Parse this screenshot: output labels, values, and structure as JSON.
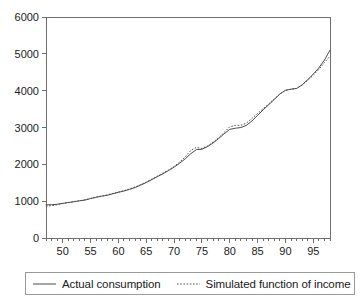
{
  "chart_data": {
    "type": "line",
    "title": "",
    "subtitle": "",
    "xlabel": "",
    "ylabel": "",
    "xlim": [
      47,
      98
    ],
    "ylim": [
      0,
      6000
    ],
    "grid": false,
    "legend_position": "bottom",
    "y_ticks": [
      0,
      1000,
      2000,
      3000,
      4000,
      5000,
      6000
    ],
    "y_tick_labels": [
      "0",
      "1000",
      "2000",
      "3000",
      "4000",
      "5000",
      "6000"
    ],
    "x_ticks": [
      50,
      55,
      60,
      65,
      70,
      75,
      80,
      85,
      90,
      95
    ],
    "x_tick_labels": [
      "50",
      "55",
      "60",
      "65",
      "70",
      "75",
      "80",
      "85",
      "90",
      "95"
    ],
    "x_minor_tick_step": 1,
    "x": [
      47,
      48,
      49,
      50,
      51,
      52,
      53,
      54,
      55,
      56,
      57,
      58,
      59,
      60,
      61,
      62,
      63,
      64,
      65,
      66,
      67,
      68,
      69,
      70,
      71,
      72,
      73,
      74,
      75,
      76,
      77,
      78,
      79,
      80,
      81,
      82,
      83,
      84,
      85,
      86,
      87,
      88,
      89,
      90,
      91,
      92,
      93,
      94,
      95,
      96,
      97,
      98
    ],
    "series": [
      {
        "name": "Actual consumption",
        "style": "solid",
        "color": "#4d4d4d",
        "values": [
          900,
          905,
          915,
          940,
          965,
          985,
          1010,
          1030,
          1070,
          1105,
          1135,
          1160,
          1200,
          1240,
          1275,
          1320,
          1370,
          1435,
          1505,
          1585,
          1665,
          1745,
          1830,
          1925,
          2030,
          2150,
          2290,
          2400,
          2410,
          2480,
          2580,
          2700,
          2830,
          2950,
          2980,
          3000,
          3060,
          3180,
          3330,
          3480,
          3620,
          3760,
          3910,
          4010,
          4040,
          4060,
          4160,
          4300,
          4450,
          4620,
          4830,
          5100
        ]
      },
      {
        "name": "Simulated function of income",
        "style": "dotted",
        "color": "#555555",
        "values": [
          860,
          880,
          905,
          935,
          960,
          985,
          1010,
          1035,
          1075,
          1110,
          1140,
          1170,
          1210,
          1250,
          1285,
          1330,
          1385,
          1450,
          1520,
          1600,
          1680,
          1760,
          1845,
          1940,
          2060,
          2200,
          2380,
          2460,
          2430,
          2500,
          2600,
          2720,
          2870,
          3020,
          3060,
          3060,
          3120,
          3250,
          3380,
          3510,
          3640,
          3780,
          3910,
          4010,
          4040,
          4060,
          4150,
          4280,
          4420,
          4580,
          4760,
          4940
        ]
      }
    ],
    "annotations": []
  },
  "legend": {
    "entries": [
      {
        "label": "Actual consumption",
        "sample": "solid-line-swatch"
      },
      {
        "label": "Simulated function of income",
        "sample": "dotted-line-swatch"
      }
    ]
  }
}
